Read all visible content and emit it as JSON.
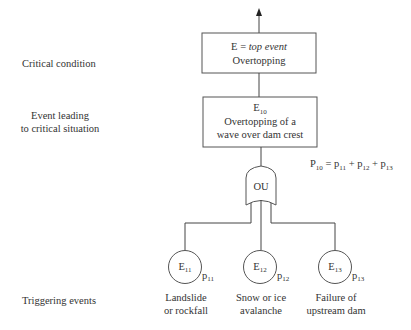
{
  "levels": {
    "critical": "Critical condition",
    "event_line1": "Event leading",
    "event_line2": "to critical situation",
    "triggering": "Triggering events"
  },
  "top_box": {
    "line1_prefix": "E = ",
    "line1_italic": "top event",
    "line2": "Overtopping"
  },
  "mid_box": {
    "symbol": "E",
    "symbol_sub": "10",
    "line1": "Overtopping of a",
    "line2": "wave over dam crest"
  },
  "gate": {
    "label": "OU",
    "type": "OR gate"
  },
  "equation": {
    "lhs": "P",
    "lhs_sub": "10",
    "eq": " = ",
    "t1": "p",
    "t1_sub": "11",
    "plus": " + ",
    "t2": "p",
    "t2_sub": "12",
    "t3": "p",
    "t3_sub": "13"
  },
  "events": [
    {
      "symbol": "E",
      "sub": "11",
      "prob": "p",
      "prob_sub": "11",
      "line1": "Landslide",
      "line2": "or rockfall"
    },
    {
      "symbol": "E",
      "sub": "12",
      "prob": "p",
      "prob_sub": "12",
      "line1": "Snow or ice",
      "line2": "avalanche"
    },
    {
      "symbol": "E",
      "sub": "13",
      "prob": "p",
      "prob_sub": "13",
      "line1": "Failure of",
      "line2": "upstream dam"
    }
  ]
}
